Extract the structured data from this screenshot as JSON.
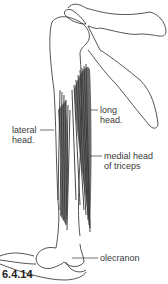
{
  "figure": {
    "number": "6.4.14",
    "labels": {
      "long_head": [
        "long",
        "head."
      ],
      "lateral_head": [
        "lateral",
        "head."
      ],
      "medial_head": [
        "medial head",
        "of triceps"
      ],
      "olecranon": "olecranon"
    }
  },
  "colors": {
    "line": "#2a2a2a",
    "muscle": "#3a3a3a",
    "text": "#3a3a3a"
  }
}
